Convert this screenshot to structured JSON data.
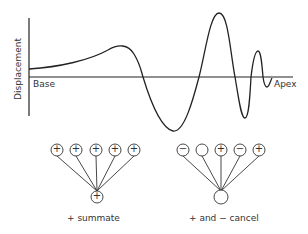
{
  "figure": {
    "y_axis_label": "Displacement",
    "base_label": "Base",
    "apex_label": "Apex",
    "colors": {
      "line": "#222222",
      "text": "#333333",
      "background": "#ffffff"
    }
  },
  "groups": [
    {
      "name": "summate",
      "inputs": [
        "+",
        "+",
        "+",
        "+",
        "+"
      ],
      "output": "+",
      "caption": "+ summate"
    },
    {
      "name": "cancel",
      "inputs": [
        "−",
        "",
        "+",
        "−",
        "+"
      ],
      "output": "",
      "caption": "+ and − cancel"
    }
  ]
}
